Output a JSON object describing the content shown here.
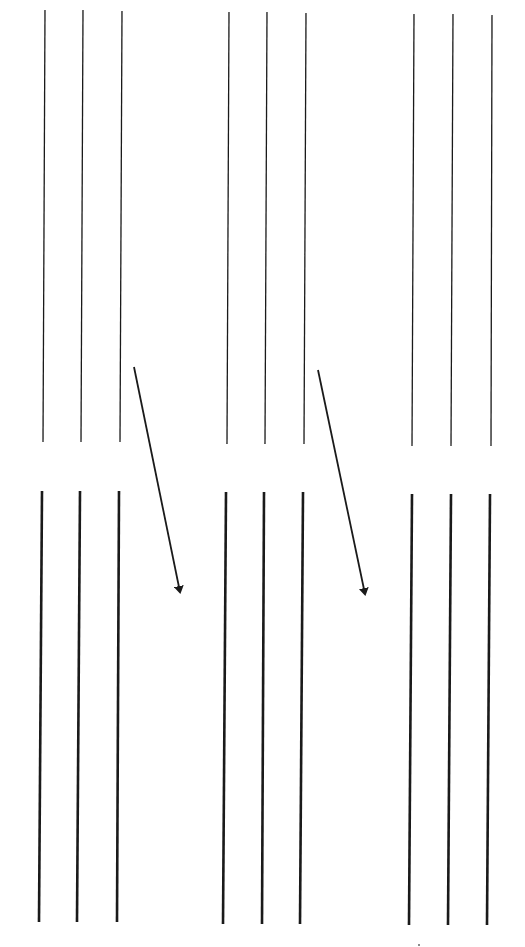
{
  "diagram": {
    "type": "line-drawing",
    "background": "#ffffff",
    "stroke_color": "#1a1a1a",
    "thin_stroke_width": 1.3,
    "thick_stroke_width": 2.6,
    "top_row": {
      "description": "thin vertical lines (before)",
      "groups": [
        {
          "lines": [
            {
              "x1": 45,
              "y1": 10,
              "x2": 43,
              "y2": 442
            },
            {
              "x1": 83,
              "y1": 10,
              "x2": 81,
              "y2": 442
            },
            {
              "x1": 122,
              "y1": 11,
              "x2": 120,
              "y2": 442
            }
          ]
        },
        {
          "lines": [
            {
              "x1": 229,
              "y1": 12,
              "x2": 227,
              "y2": 444
            },
            {
              "x1": 267,
              "y1": 12,
              "x2": 265,
              "y2": 444
            },
            {
              "x1": 306,
              "y1": 13,
              "x2": 304,
              "y2": 444
            }
          ]
        },
        {
          "lines": [
            {
              "x1": 414,
              "y1": 14,
              "x2": 412,
              "y2": 446
            },
            {
              "x1": 453,
              "y1": 14,
              "x2": 451,
              "y2": 446
            },
            {
              "x1": 492,
              "y1": 15,
              "x2": 491,
              "y2": 446
            }
          ]
        }
      ]
    },
    "bottom_row": {
      "description": "thick vertical lines (after)",
      "groups": [
        {
          "lines": [
            {
              "x1": 42,
              "y1": 491,
              "x2": 39,
              "y2": 922
            },
            {
              "x1": 80,
              "y1": 491,
              "x2": 77,
              "y2": 922
            },
            {
              "x1": 119,
              "y1": 491,
              "x2": 117,
              "y2": 922
            }
          ]
        },
        {
          "lines": [
            {
              "x1": 226,
              "y1": 492,
              "x2": 223,
              "y2": 924
            },
            {
              "x1": 264,
              "y1": 492,
              "x2": 262,
              "y2": 924
            },
            {
              "x1": 303,
              "y1": 492,
              "x2": 300,
              "y2": 924
            }
          ]
        },
        {
          "lines": [
            {
              "x1": 412,
              "y1": 494,
              "x2": 409,
              "y2": 925
            },
            {
              "x1": 451,
              "y1": 494,
              "x2": 448,
              "y2": 925
            },
            {
              "x1": 490,
              "y1": 494,
              "x2": 487,
              "y2": 925
            }
          ]
        }
      ]
    },
    "arrows": [
      {
        "x1": 134,
        "y1": 367,
        "x2": 180,
        "y2": 592
      },
      {
        "x1": 318,
        "y1": 370,
        "x2": 365,
        "y2": 594
      }
    ],
    "marks": [
      {
        "x": 419,
        "y": 945,
        "r": 1
      }
    ]
  }
}
